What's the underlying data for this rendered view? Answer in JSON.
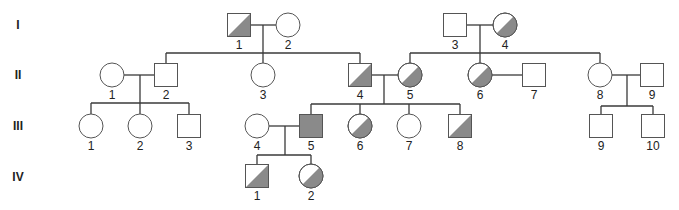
{
  "diagram": {
    "type": "pedigree",
    "shade_color": "#8a8a8a",
    "stroke_color": "#555555",
    "generations": [
      {
        "label": "I",
        "y": 25
      },
      {
        "label": "II",
        "y": 75
      },
      {
        "label": "III",
        "y": 126
      },
      {
        "label": "IV",
        "y": 177
      }
    ],
    "individuals": [
      {
        "id": "I-1",
        "gen": "I",
        "num": "1",
        "sex": "male",
        "status": "carrier",
        "cx": 239,
        "cy": 25
      },
      {
        "id": "I-2",
        "gen": "I",
        "num": "2",
        "sex": "female",
        "status": "unaffected",
        "cx": 288,
        "cy": 25
      },
      {
        "id": "I-3",
        "gen": "I",
        "num": "3",
        "sex": "male",
        "status": "unaffected",
        "cx": 455,
        "cy": 25
      },
      {
        "id": "I-4",
        "gen": "I",
        "num": "4",
        "sex": "female",
        "status": "carrier",
        "cx": 505,
        "cy": 25
      },
      {
        "id": "II-1",
        "gen": "II",
        "num": "1",
        "sex": "female",
        "status": "unaffected",
        "cx": 112,
        "cy": 75
      },
      {
        "id": "II-2",
        "gen": "II",
        "num": "2",
        "sex": "male",
        "status": "unaffected",
        "cx": 166,
        "cy": 75
      },
      {
        "id": "II-3",
        "gen": "II",
        "num": "3",
        "sex": "female",
        "status": "unaffected",
        "cx": 263,
        "cy": 75
      },
      {
        "id": "II-4",
        "gen": "II",
        "num": "4",
        "sex": "male",
        "status": "carrier",
        "cx": 360,
        "cy": 75
      },
      {
        "id": "II-5",
        "gen": "II",
        "num": "5",
        "sex": "female",
        "status": "carrier",
        "cx": 410,
        "cy": 75
      },
      {
        "id": "II-6",
        "gen": "II",
        "num": "6",
        "sex": "female",
        "status": "carrier",
        "cx": 480,
        "cy": 75
      },
      {
        "id": "II-7",
        "gen": "II",
        "num": "7",
        "sex": "male",
        "status": "unaffected",
        "cx": 534,
        "cy": 75
      },
      {
        "id": "II-8",
        "gen": "II",
        "num": "8",
        "sex": "female",
        "status": "unaffected",
        "cx": 600,
        "cy": 75
      },
      {
        "id": "II-9",
        "gen": "II",
        "num": "9",
        "sex": "male",
        "status": "unaffected",
        "cx": 652,
        "cy": 75
      },
      {
        "id": "III-1",
        "gen": "III",
        "num": "1",
        "sex": "female",
        "status": "unaffected",
        "cx": 91,
        "cy": 126
      },
      {
        "id": "III-2",
        "gen": "III",
        "num": "2",
        "sex": "female",
        "status": "unaffected",
        "cx": 140,
        "cy": 126
      },
      {
        "id": "III-3",
        "gen": "III",
        "num": "3",
        "sex": "male",
        "status": "unaffected",
        "cx": 189,
        "cy": 126
      },
      {
        "id": "III-4",
        "gen": "III",
        "num": "4",
        "sex": "female",
        "status": "unaffected",
        "cx": 257,
        "cy": 126
      },
      {
        "id": "III-5",
        "gen": "III",
        "num": "5",
        "sex": "male",
        "status": "affected",
        "cx": 311,
        "cy": 126
      },
      {
        "id": "III-6",
        "gen": "III",
        "num": "6",
        "sex": "female",
        "status": "carrier",
        "cx": 360,
        "cy": 126
      },
      {
        "id": "III-7",
        "gen": "III",
        "num": "7",
        "sex": "female",
        "status": "unaffected",
        "cx": 409,
        "cy": 126
      },
      {
        "id": "III-8",
        "gen": "III",
        "num": "8",
        "sex": "male",
        "status": "carrier",
        "cx": 460,
        "cy": 126
      },
      {
        "id": "III-9",
        "gen": "III",
        "num": "9",
        "sex": "male",
        "status": "unaffected",
        "cx": 601,
        "cy": 126
      },
      {
        "id": "III-10",
        "gen": "III",
        "num": "10",
        "sex": "male",
        "status": "unaffected",
        "cx": 653,
        "cy": 126
      },
      {
        "id": "IV-1",
        "gen": "IV",
        "num": "1",
        "sex": "male",
        "status": "carrier",
        "cx": 257,
        "cy": 176
      },
      {
        "id": "IV-2",
        "gen": "IV",
        "num": "2",
        "sex": "female",
        "status": "carrier",
        "cx": 311,
        "cy": 176
      }
    ],
    "lines": [
      [
        251,
        25,
        276,
        25
      ],
      [
        263,
        25,
        263,
        53
      ],
      [
        166,
        53,
        360,
        53
      ],
      [
        166,
        53,
        166,
        64
      ],
      [
        263,
        53,
        263,
        63
      ],
      [
        360,
        53,
        360,
        64
      ],
      [
        467,
        25,
        493,
        25
      ],
      [
        480,
        25,
        480,
        53
      ],
      [
        410,
        53,
        600,
        53
      ],
      [
        410,
        53,
        410,
        63
      ],
      [
        480,
        53,
        480,
        63
      ],
      [
        600,
        53,
        600,
        63
      ],
      [
        124,
        75,
        155,
        75
      ],
      [
        140,
        75,
        140,
        103
      ],
      [
        91,
        103,
        189,
        103
      ],
      [
        91,
        103,
        91,
        114
      ],
      [
        140,
        103,
        140,
        114
      ],
      [
        189,
        103,
        189,
        115
      ],
      [
        372,
        75,
        398,
        75
      ],
      [
        384,
        75,
        384,
        104
      ],
      [
        311,
        104,
        460,
        104
      ],
      [
        311,
        104,
        311,
        115
      ],
      [
        360,
        104,
        360,
        114
      ],
      [
        409,
        104,
        409,
        114
      ],
      [
        460,
        104,
        460,
        115
      ],
      [
        492,
        75,
        523,
        75
      ],
      [
        612,
        75,
        641,
        75
      ],
      [
        627,
        75,
        627,
        106
      ],
      [
        601,
        106,
        653,
        106
      ],
      [
        601,
        106,
        601,
        115
      ],
      [
        653,
        106,
        653,
        115
      ],
      [
        269,
        126,
        300,
        126
      ],
      [
        285,
        126,
        285,
        155
      ],
      [
        257,
        155,
        311,
        155
      ],
      [
        257,
        155,
        257,
        165
      ],
      [
        311,
        155,
        311,
        164
      ]
    ]
  }
}
